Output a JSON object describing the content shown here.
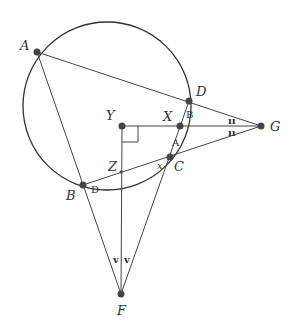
{
  "diagram": {
    "type": "geometry",
    "circle": {
      "cx": 107,
      "cy": 106,
      "r": 84
    },
    "points": {
      "A": {
        "x": 37,
        "y": 52,
        "label": "A",
        "lx": 20,
        "ly": 50
      },
      "D": {
        "x": 189,
        "y": 101,
        "label": "D",
        "lx": 196,
        "ly": 96
      },
      "X": {
        "x": 180,
        "y": 126,
        "label": "X",
        "lx": 163,
        "ly": 121
      },
      "Y": {
        "x": 122,
        "y": 126,
        "label": "Y",
        "lx": 106,
        "ly": 120
      },
      "G": {
        "x": 261,
        "y": 126,
        "label": "G",
        "lx": 270,
        "ly": 131
      },
      "C": {
        "x": 170,
        "y": 157,
        "label": "C",
        "lx": 174,
        "ly": 171
      },
      "Z": {
        "x": 121,
        "y": 172,
        "label": "Z",
        "lx": 108,
        "ly": 171
      },
      "B": {
        "x": 83,
        "y": 185,
        "label": "B",
        "lx": 66,
        "ly": 200
      },
      "F": {
        "x": 121,
        "y": 294,
        "label": "F",
        "lx": 117,
        "ly": 315
      }
    },
    "angle_labels": [
      {
        "text": "B",
        "x": 186,
        "y": 118
      },
      {
        "text": "A",
        "x": 172,
        "y": 146
      },
      {
        "text": "x",
        "x": 157,
        "y": 169
      },
      {
        "text": "D",
        "x": 91,
        "y": 193
      }
    ],
    "tick_marks": [
      {
        "text": "ıı",
        "x": 228,
        "y": 124,
        "note": "angle mark above YG at G"
      },
      {
        "text": "ıı",
        "x": 228,
        "y": 136,
        "note": "angle mark below YG at G"
      },
      {
        "text": "v",
        "x": 113,
        "y": 263,
        "note": "angle mark at F (left)"
      },
      {
        "text": "v",
        "x": 124,
        "y": 263,
        "note": "angle mark at F (right)"
      }
    ],
    "segments": [
      [
        "A",
        "G"
      ],
      [
        "A",
        "F"
      ],
      [
        "Y",
        "G"
      ],
      [
        "B",
        "G"
      ],
      [
        "F",
        "D"
      ],
      [
        "Y",
        "F"
      ]
    ],
    "right_angle_at": "Y"
  }
}
